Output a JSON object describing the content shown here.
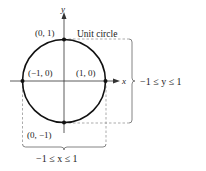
{
  "diagram": {
    "title": "Unit circle",
    "axes": {
      "x_label": "x",
      "y_label": "y"
    },
    "points": [
      {
        "label": "(0, 1)",
        "x": 0,
        "y": 1
      },
      {
        "label": "(−1, 0)",
        "x": -1,
        "y": 0
      },
      {
        "label": "(1, 0)",
        "x": 1,
        "y": 0
      },
      {
        "label": "(0, −1)",
        "x": 0,
        "y": -1
      }
    ],
    "y_range_label": "−1 ≤ y ≤ 1",
    "x_range_label": "−1 ≤ x ≤ 1",
    "colors": {
      "circle": "#111111",
      "axes": "#333333",
      "dashed": "#888888"
    }
  }
}
